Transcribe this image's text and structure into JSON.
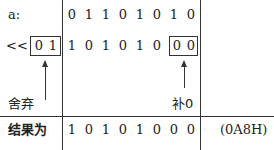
{
  "rows": {
    "a": {
      "label": "a:",
      "bits": [
        "0",
        "1",
        "1",
        "0",
        "1",
        "0",
        "1",
        "0"
      ]
    },
    "shifted": {
      "label": "<<",
      "discarded_bits": [
        "0",
        "1"
      ],
      "bits": [
        "1",
        "0",
        "1",
        "0",
        "1",
        "0"
      ],
      "filled_bits": [
        "0",
        "0"
      ]
    },
    "annotations": {
      "discard_label": "舍弃",
      "fill_label": "补0"
    },
    "result": {
      "label": "结果为",
      "bits": [
        "1",
        "0",
        "1",
        "0",
        "1",
        "0",
        "0",
        "0"
      ],
      "hex": "(0A8H)"
    }
  }
}
